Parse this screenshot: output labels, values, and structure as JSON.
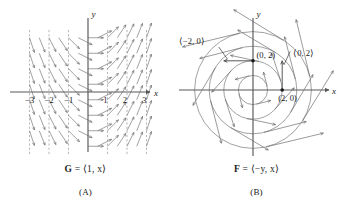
{
  "figure": {
    "background": "#ffffff",
    "axis_color": "#58585a",
    "vector_color": "#6e6e72",
    "curve_color": "#7a7a80",
    "dash_color": "#9a9a9e",
    "text_color": "#1a1a1a"
  },
  "panel_a": {
    "caption_formula_html": "<b>G</b> = ⟨1, x⟩",
    "caption_label": "(A)",
    "axis_x_label": "x",
    "axis_y_label": "y",
    "x_ticks": [
      "−3",
      "−2",
      "−1",
      "1",
      "2",
      "3"
    ],
    "x_tick_values": [
      -3,
      -2,
      -1,
      1,
      2,
      3
    ],
    "dashed_gridlines_x": [
      -3,
      -2,
      -1,
      1,
      2,
      3
    ],
    "field_definition": "G(x,y) = <1, x>",
    "sample_x": [
      -3,
      -2.5,
      -2,
      -1.5,
      -1,
      -0.5,
      0,
      0.5,
      1,
      1.5,
      2,
      2.5,
      3
    ],
    "sample_y": [
      -3.5,
      -2.5,
      -1.5,
      -0.5,
      0.5,
      1.5,
      2.5,
      3.5
    ]
  },
  "panel_b": {
    "caption_formula_html": "<b>F</b> = ⟨−y, x⟩",
    "caption_label": "(B)",
    "axis_x_label": "x",
    "axis_y_label": "y",
    "annotations": [
      {
        "text": "⟨−2, 0⟩",
        "note": "vector at point (0, 2), points left"
      },
      {
        "text": "(0, 2)",
        "note": "point label on positive y-axis"
      },
      {
        "text": "⟨0, 2⟩",
        "note": "vector at point (2, 0), points up"
      },
      {
        "text": "(2, 0)",
        "note": "point label on positive x-axis"
      }
    ],
    "marked_points": [
      {
        "label": "(0, 2)",
        "x": 0,
        "y": 2
      },
      {
        "label": "(2, 0)",
        "x": 2,
        "y": 0
      }
    ],
    "circle_radii": [
      1,
      2,
      3,
      4
    ],
    "field_definition": "F(x,y) = <-y, x>"
  },
  "chart_data": {
    "type": "scatter",
    "title": "",
    "panels": [
      {
        "id": "A",
        "type": "vector-field",
        "title": "G = <1, x>",
        "xlabel": "x",
        "ylabel": "y",
        "xlim": [
          -3.6,
          3.6
        ],
        "ylim": [
          -4.2,
          4.2
        ],
        "xticks": [
          -3,
          -2,
          -1,
          1,
          2,
          3
        ],
        "yticks": [],
        "grid": "vertical dashed lines at integer x",
        "legend": "none",
        "field": "G(x,y) = (1, x)",
        "description": "Arrows all of the same length whose slope equals x; vertical at far left/right, horizontal on the y-axis."
      },
      {
        "id": "B",
        "type": "vector-field",
        "title": "F = <-y, x>",
        "xlabel": "x",
        "ylabel": "y",
        "xlim": [
          -4.6,
          4.6
        ],
        "ylim": [
          -4.6,
          4.6
        ],
        "xticks": [],
        "yticks": [],
        "grid": "concentric circles radius 1,2,3,4",
        "legend": "none",
        "field": "F(x,y) = (-y, x)",
        "labelled_vectors": [
          {
            "at": [
              0,
              2
            ],
            "vector": [
              -2,
              0
            ],
            "label": "<-2, 0>"
          },
          {
            "at": [
              2,
              0
            ],
            "vector": [
              0,
              2
            ],
            "label": "<0, 2>"
          }
        ],
        "description": "Rotational field tangent to concentric circles, counterclockwise, magnitude growing with radius."
      }
    ]
  }
}
